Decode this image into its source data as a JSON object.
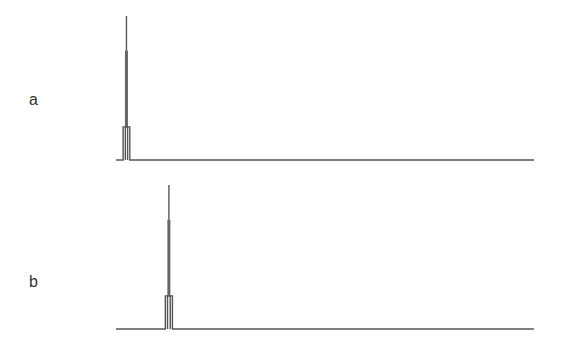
{
  "chart_data": {
    "type": "line",
    "title": "",
    "xlabel": "",
    "ylabel": "",
    "axes_visible": false,
    "grid": false,
    "legend": "none",
    "xlim": [
      0,
      100
    ],
    "ylim": [
      0,
      1
    ],
    "panels": [
      {
        "label": "a",
        "series": [
          {
            "name": "a",
            "x": [
              0,
              1.7,
              1.7,
              3.3,
              3.3,
              100
            ],
            "y": [
              0,
              0,
              0.23,
              0.23,
              0,
              0
            ],
            "peak": {
              "x": 2.5,
              "height": 1.0,
              "core_top": 0.76
            }
          }
        ]
      },
      {
        "label": "b",
        "series": [
          {
            "name": "b",
            "x": [
              0,
              11.8,
              11.8,
              13.5,
              13.5,
              100
            ],
            "y": [
              0,
              0,
              0.23,
              0.23,
              0,
              0
            ],
            "peak": {
              "x": 12.65,
              "height": 1.0,
              "core_top": 0.76
            }
          }
        ]
      }
    ]
  }
}
